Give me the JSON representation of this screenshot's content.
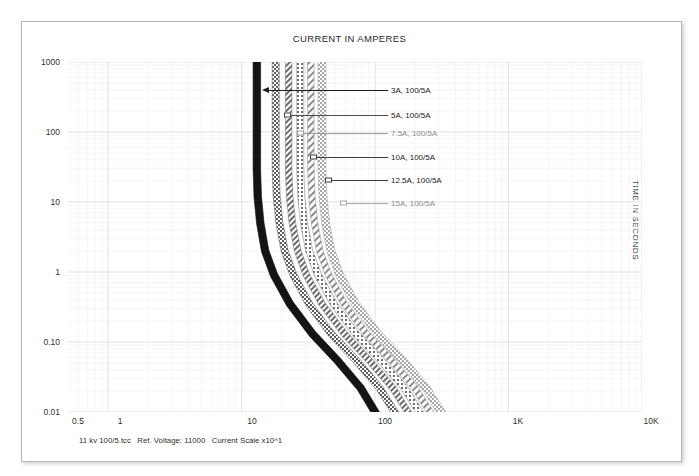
{
  "document": {
    "title": "CURRENT IN AMPERES",
    "y_axis_title": "TIME IN SECONDS",
    "footer": "11 kv 100/5.tcc   Ref. Voltage: 11000   Current Scale x10^1"
  },
  "axes": {
    "y_ticks": [
      "1000",
      "100",
      "10",
      "1",
      "0.10",
      "0.01"
    ],
    "x_ticks": [
      "0.5",
      "1",
      "10",
      "100",
      "1K",
      "10K"
    ]
  },
  "annotations": [
    {
      "label": "3A, 100/5A",
      "tone": "dark"
    },
    {
      "label": "5A, 100/5A",
      "tone": "dark"
    },
    {
      "label": "7.5A, 100/5A",
      "tone": "faint"
    },
    {
      "label": "10A, 100/5A",
      "tone": "dark"
    },
    {
      "label": "12.5A, 100/5A",
      "tone": "dark"
    },
    {
      "label": "15A, 100/5A",
      "tone": "faint"
    }
  ],
  "colors": {
    "frame": "#b4b4b4",
    "grid_major": "#d9d9e2",
    "grid_minor": "#ededf2",
    "text": "#2b2b2b",
    "curve_primary": "#151515",
    "curve_faint": "#9a9a9a"
  },
  "chart_data": {
    "type": "line",
    "title": "CURRENT IN AMPERES",
    "xlabel": "CURRENT IN AMPERES",
    "ylabel": "TIME IN SECONDS",
    "xscale": "log",
    "yscale": "log",
    "xlim": [
      0.5,
      10000
    ],
    "ylim": [
      0.01,
      1000
    ],
    "x_tick_values": [
      0.5,
      1,
      10,
      100,
      1000,
      10000
    ],
    "x_tick_labels": [
      "0.5",
      "1",
      "10",
      "100",
      "1K",
      "10K"
    ],
    "y_tick_values": [
      0.01,
      0.1,
      1,
      10,
      100,
      1000
    ],
    "y_tick_labels": [
      "0.01",
      "0.10",
      "1",
      "10",
      "100",
      "1000"
    ],
    "grid": true,
    "legend": "inline-annotations",
    "note": "Time-current characteristic (TCC) curves; each series is drawn as a thick tolerance band.",
    "series": [
      {
        "name": "3A, 100/5A",
        "band": true,
        "x": [
          13.0,
          13.0,
          13.2,
          13.8,
          15.0,
          17.5,
          23.0,
          34.0,
          52.0,
          78.0,
          100.0
        ],
        "y": [
          1000,
          30,
          12,
          5.0,
          2.0,
          0.9,
          0.35,
          0.13,
          0.055,
          0.022,
          0.01
        ]
      },
      {
        "name": "5A, 100/5A",
        "band": true,
        "x": [
          18.0,
          18.0,
          18.3,
          19.2,
          21.0,
          24.5,
          32.0,
          47.0,
          72.0,
          108.0,
          140.0
        ],
        "y": [
          1000,
          30,
          12,
          5.0,
          2.0,
          0.9,
          0.35,
          0.13,
          0.055,
          0.022,
          0.01
        ]
      },
      {
        "name": "7.5A, 100/5A",
        "band": true,
        "x": [
          22.5,
          22.5,
          22.9,
          24.0,
          26.3,
          30.6,
          40.0,
          59.0,
          90.0,
          136.0,
          176.0
        ],
        "y": [
          1000,
          30,
          12,
          5.0,
          2.0,
          0.9,
          0.35,
          0.13,
          0.055,
          0.022,
          0.01
        ]
      },
      {
        "name": "10A, 100/5A",
        "band": true,
        "x": [
          27.5,
          27.5,
          28.0,
          29.3,
          32.1,
          37.4,
          49.0,
          72.0,
          110.0,
          166.0,
          215.0
        ],
        "y": [
          1000,
          30,
          12,
          5.0,
          2.0,
          0.9,
          0.35,
          0.13,
          0.055,
          0.022,
          0.01
        ]
      },
      {
        "name": "12.5A, 100/5A",
        "band": true,
        "x": [
          33.0,
          33.0,
          33.6,
          35.2,
          38.5,
          44.9,
          58.8,
          86.4,
          132.0,
          199.0,
          258.0
        ],
        "y": [
          1000,
          30,
          12,
          5.0,
          2.0,
          0.9,
          0.35,
          0.13,
          0.055,
          0.022,
          0.01
        ]
      },
      {
        "name": "15A, 100/5A",
        "band": true,
        "x": [
          40.0,
          40.0,
          40.7,
          42.6,
          46.6,
          54.4,
          71.2,
          105.0,
          160.0,
          241.0,
          312.0
        ],
        "y": [
          1000,
          30,
          12,
          5.0,
          2.0,
          0.9,
          0.35,
          0.13,
          0.055,
          0.022,
          0.01
        ]
      }
    ]
  }
}
